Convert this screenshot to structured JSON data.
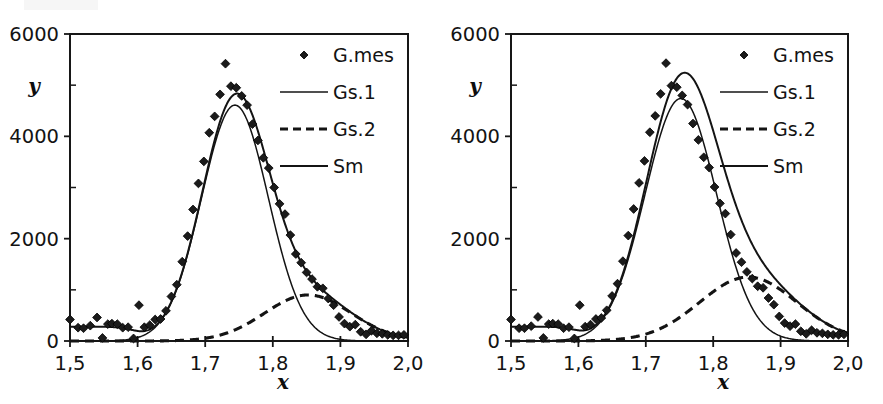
{
  "figure": {
    "panel_count": 2,
    "background_color": "#ffffff",
    "ink_color": "#141414"
  },
  "chart_data": [
    {
      "type": "line",
      "panel": "left",
      "title": "",
      "subtitle": "",
      "xlabel": "x",
      "ylabel": "y",
      "xlim": [
        1.5,
        2.0
      ],
      "ylim": [
        0,
        6000
      ],
      "xticks": [
        1.5,
        1.6,
        1.7,
        1.8,
        1.9,
        2.0
      ],
      "xticklabels": [
        "1,5",
        "1,6",
        "1,7",
        "1,8",
        "1,9",
        "2,0"
      ],
      "yticks": [
        0,
        2000,
        4000,
        6000
      ],
      "yticklabels": [
        "0",
        "2000",
        "4000",
        "6000"
      ],
      "yminorticks": [
        1000,
        3000,
        5000
      ],
      "grid": false,
      "legend_position": "top-right",
      "legend": [
        {
          "label": "G.mes",
          "style": "marker-diamond"
        },
        {
          "label": "Gs.1",
          "style": "line-solid-thin"
        },
        {
          "label": "Gs.2",
          "style": "line-dashed"
        },
        {
          "label": "Sm",
          "style": "line-solid-thick"
        }
      ],
      "series": [
        {
          "name": "G.mes",
          "style": "scatter",
          "x": [
            1.5,
            1.512,
            1.52,
            1.53,
            1.54,
            1.548,
            1.556,
            1.562,
            1.57,
            1.578,
            1.586,
            1.594,
            1.602,
            1.61,
            1.618,
            1.626,
            1.634,
            1.642,
            1.65,
            1.658,
            1.666,
            1.674,
            1.682,
            1.69,
            1.698,
            1.706,
            1.714,
            1.722,
            1.73,
            1.738,
            1.746,
            1.754,
            1.762,
            1.77,
            1.778,
            1.786,
            1.794,
            1.802,
            1.81,
            1.818,
            1.826,
            1.834,
            1.842,
            1.85,
            1.858,
            1.866,
            1.874,
            1.882,
            1.89,
            1.898,
            1.906,
            1.914,
            1.922,
            1.93,
            1.938,
            1.946,
            1.954,
            1.962,
            1.97,
            1.978,
            1.986,
            1.994
          ],
          "y": [
            420,
            260,
            250,
            300,
            460,
            60,
            330,
            340,
            330,
            260,
            270,
            50,
            700,
            270,
            310,
            420,
            430,
            590,
            870,
            1100,
            1550,
            2050,
            2570,
            3080,
            3510,
            4070,
            4390,
            4820,
            5420,
            4980,
            4950,
            4790,
            4610,
            4240,
            3920,
            3580,
            3380,
            3000,
            2680,
            2480,
            2070,
            1700,
            1530,
            1340,
            1210,
            1060,
            1030,
            830,
            700,
            470,
            340,
            280,
            320,
            180,
            130,
            200,
            150,
            140,
            120,
            110,
            110,
            120
          ]
        },
        {
          "name": "Gs.1",
          "style": "gaussian",
          "amplitude": 4610,
          "center": 1.744,
          "sigma": 0.0495,
          "baseline": 0
        },
        {
          "name": "Gs.2",
          "style": "gaussian-dashed",
          "amplitude": 900,
          "center": 1.852,
          "sigma": 0.064,
          "baseline": 0
        },
        {
          "name": "Sm",
          "style": "sum-plus-background",
          "description": "Sum of Gs.1 and Gs.2 plus a low-x background shelf",
          "background_level": 280,
          "background_edge": 1.598
        }
      ]
    },
    {
      "type": "line",
      "panel": "right",
      "title": "",
      "subtitle": "",
      "xlabel": "x",
      "ylabel": "y",
      "xlim": [
        1.5,
        2.0
      ],
      "ylim": [
        0,
        6000
      ],
      "xticks": [
        1.5,
        1.6,
        1.7,
        1.8,
        1.9,
        2.0
      ],
      "xticklabels": [
        "1,5",
        "1,6",
        "1,7",
        "1,8",
        "1,9",
        "2,0"
      ],
      "yticks": [
        0,
        2000,
        4000,
        6000
      ],
      "yticklabels": [
        "0",
        "2000",
        "4000",
        "6000"
      ],
      "yminorticks": [
        1000,
        3000,
        5000
      ],
      "grid": false,
      "legend_position": "top-right",
      "legend": [
        {
          "label": "G.mes",
          "style": "marker-diamond"
        },
        {
          "label": "Gs.1",
          "style": "line-solid-thin"
        },
        {
          "label": "Gs.2",
          "style": "line-dashed"
        },
        {
          "label": "Sm",
          "style": "line-solid-thick"
        }
      ],
      "series": [
        {
          "name": "G.mes",
          "style": "scatter",
          "x": [
            1.5,
            1.512,
            1.52,
            1.53,
            1.54,
            1.548,
            1.556,
            1.562,
            1.57,
            1.578,
            1.586,
            1.594,
            1.602,
            1.61,
            1.618,
            1.626,
            1.634,
            1.642,
            1.65,
            1.658,
            1.666,
            1.674,
            1.682,
            1.69,
            1.698,
            1.706,
            1.714,
            1.722,
            1.73,
            1.738,
            1.746,
            1.754,
            1.762,
            1.77,
            1.778,
            1.786,
            1.794,
            1.802,
            1.81,
            1.818,
            1.826,
            1.834,
            1.842,
            1.85,
            1.858,
            1.866,
            1.874,
            1.882,
            1.89,
            1.898,
            1.906,
            1.914,
            1.922,
            1.93,
            1.938,
            1.946,
            1.954,
            1.962,
            1.97,
            1.978,
            1.986,
            1.994
          ],
          "y": [
            420,
            250,
            250,
            290,
            470,
            60,
            330,
            340,
            330,
            250,
            270,
            50,
            700,
            280,
            320,
            430,
            450,
            600,
            880,
            1120,
            1560,
            2060,
            2580,
            3090,
            3520,
            4080,
            4400,
            4830,
            5430,
            4990,
            4960,
            4800,
            4620,
            4250,
            3930,
            3590,
            3390,
            3010,
            2690,
            2490,
            2080,
            1720,
            1540,
            1350,
            1220,
            1070,
            1040,
            840,
            710,
            480,
            350,
            290,
            330,
            190,
            140,
            210,
            160,
            150,
            130,
            120,
            120,
            130
          ]
        },
        {
          "name": "Gs.1",
          "style": "gaussian",
          "amplitude": 4740,
          "center": 1.752,
          "sigma": 0.053,
          "baseline": 0
        },
        {
          "name": "Gs.2",
          "style": "gaussian-dashed",
          "amplitude": 1250,
          "center": 1.852,
          "sigma": 0.072,
          "baseline": 0
        },
        {
          "name": "Sm",
          "style": "sum-plus-background",
          "description": "Sum of Gs.1 and Gs.2 plus a low-x background shelf",
          "background_level": 280,
          "background_edge": 1.598
        }
      ]
    }
  ]
}
